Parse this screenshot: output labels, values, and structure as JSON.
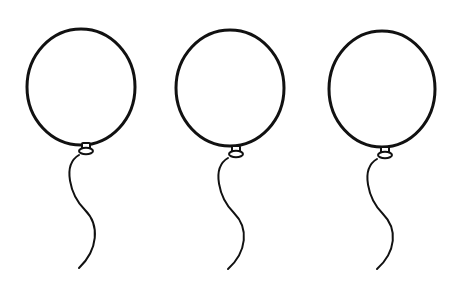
{
  "scene": {
    "description": "Three identical line-art balloons with strings",
    "background": "#ffffff",
    "stroke_color": "#111111",
    "balloon_count": 3
  },
  "balloons": [
    {
      "name": "balloon-1",
      "cx": 81,
      "cy": 87,
      "rx": 54,
      "ry": 58,
      "knot_x": 86,
      "knot_y": 150,
      "string_path": "M79 155 C 62 165, 70 195, 85 210 C 100 225, 98 250, 79 268"
    },
    {
      "name": "balloon-2",
      "cx": 230,
      "cy": 88,
      "rx": 54,
      "ry": 58,
      "knot_x": 236,
      "knot_y": 153,
      "string_path": "M228 158 C 211 168, 219 198, 234 213 C 249 228, 247 252, 228 269"
    },
    {
      "name": "balloon-3",
      "cx": 382,
      "cy": 89,
      "rx": 53,
      "ry": 58,
      "knot_x": 385,
      "knot_y": 154,
      "string_path": "M377 159 C 360 169, 368 199, 383 214 C 398 229, 396 252, 377 269"
    }
  ]
}
